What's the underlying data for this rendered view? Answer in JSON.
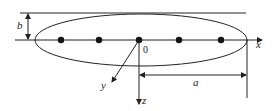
{
  "diagram": {
    "labels": {
      "x_axis": "x",
      "y_axis": "y",
      "z_axis": "z",
      "origin": "0",
      "semi_major": "a",
      "semi_minor": "b"
    },
    "dots_count": 5,
    "colors": {
      "stroke": "#222222",
      "background": "#ffffff"
    }
  }
}
